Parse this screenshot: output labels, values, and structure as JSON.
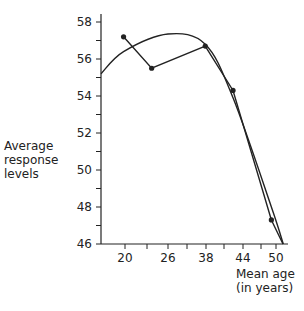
{
  "chart_data": {
    "type": "line",
    "title": "",
    "xlabel": "Mean age (in years)",
    "xlabel_lines": [
      "Mean age",
      "(in years)"
    ],
    "ylabel": "Average response levels",
    "ylabel_lines": [
      "Average",
      "response",
      "levels"
    ],
    "ylim": [
      46,
      58
    ],
    "yticks": [
      46,
      48,
      50,
      52,
      54,
      56,
      58
    ],
    "xtick_labels": [
      "20",
      "26",
      "38",
      "44",
      "50"
    ],
    "grid": false,
    "legend": null,
    "series": [
      {
        "name": "observed means",
        "style": "line-with-markers",
        "points": [
          {
            "x_pos": 0.94,
            "y": 57.2
          },
          {
            "x_pos": 1.62,
            "y": 55.5
          },
          {
            "x_pos": 2.98,
            "y": 56.7
          },
          {
            "x_pos": 3.73,
            "y": 54.3
          },
          {
            "x_pos": 4.86,
            "y": 47.3
          }
        ]
      },
      {
        "name": "fitted curve",
        "style": "smooth-line",
        "points": [
          {
            "x_pos": 0.0,
            "y": 55.2
          },
          {
            "x_pos": 0.94,
            "y": 56.4
          },
          {
            "x_pos": 2.0,
            "y": 57.35
          },
          {
            "x_pos": 2.98,
            "y": 56.8
          },
          {
            "x_pos": 3.73,
            "y": 53.9
          },
          {
            "x_pos": 4.86,
            "y": 48.0
          },
          {
            "x_pos": 5.22,
            "y": 46.0
          }
        ]
      }
    ]
  },
  "labels": {
    "ylabel_1": "Average",
    "ylabel_2": "response",
    "ylabel_3": "levels",
    "xlabel_1": "Mean age",
    "xlabel_2": "(in years)"
  }
}
